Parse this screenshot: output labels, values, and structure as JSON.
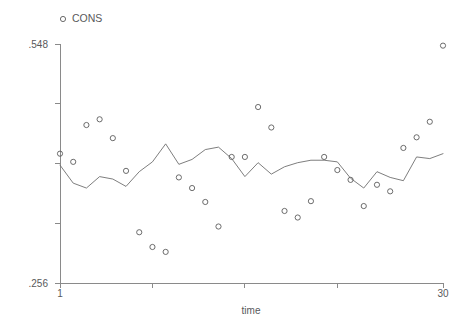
{
  "chart_data": {
    "type": "scatter",
    "title": "",
    "xlabel": "time",
    "ylabel": "",
    "xlim": [
      1,
      30
    ],
    "ylim": [
      0.256,
      0.548
    ],
    "grid": false,
    "legend_position": "top-left",
    "legend": [
      {
        "label": "CONS",
        "marker": "open-circle"
      }
    ],
    "y_tick_labels": [
      ".548",
      "",
      "",
      "",
      ".256"
    ],
    "y_tick_values": [
      0.548,
      0.475,
      0.402,
      0.329,
      0.256
    ],
    "x_tick_labels": [
      "1",
      "",
      "",
      "",
      "30"
    ],
    "x_tick_values": [
      1,
      8,
      15,
      22,
      30
    ],
    "x": [
      1,
      2,
      3,
      4,
      5,
      6,
      7,
      8,
      9,
      10,
      11,
      12,
      13,
      14,
      15,
      16,
      17,
      18,
      19,
      20,
      21,
      22,
      23,
      24,
      25,
      26,
      27,
      28,
      29,
      30
    ],
    "series": [
      {
        "name": "CONS",
        "type": "scatter",
        "marker": "open-circle",
        "color": "#5c5c5c",
        "values": [
          0.414,
          0.404,
          0.449,
          0.456,
          0.433,
          0.393,
          0.318,
          0.3,
          0.294,
          0.385,
          0.372,
          0.355,
          0.325,
          0.41,
          0.41,
          0.471,
          0.446,
          0.344,
          0.336,
          0.356,
          0.41,
          0.394,
          0.382,
          0.35,
          0.376,
          0.368,
          0.421,
          0.434,
          0.453,
          0.546
        ]
      },
      {
        "name": "fitted",
        "type": "line",
        "color": "#6f6f6f",
        "values": [
          0.4,
          0.378,
          0.372,
          0.386,
          0.383,
          0.374,
          0.392,
          0.404,
          0.426,
          0.401,
          0.407,
          0.419,
          0.422,
          0.408,
          0.386,
          0.403,
          0.389,
          0.398,
          0.403,
          0.406,
          0.406,
          0.404,
          0.384,
          0.372,
          0.392,
          0.385,
          0.381,
          0.41,
          0.408,
          0.414
        ]
      }
    ]
  },
  "geometry": {
    "plot_left": 60,
    "plot_right": 443,
    "plot_top": 44,
    "plot_bottom": 283,
    "marker_radius": 2.6,
    "legend_marker_x": 63,
    "legend_marker_y": 19,
    "legend_text_x": 72,
    "legend_text_y": 22,
    "y_label_x": 48,
    "x_axis_title_x": 251,
    "x_axis_title_y": 314,
    "x_tick_label_y": 297,
    "tick_len": 5
  }
}
